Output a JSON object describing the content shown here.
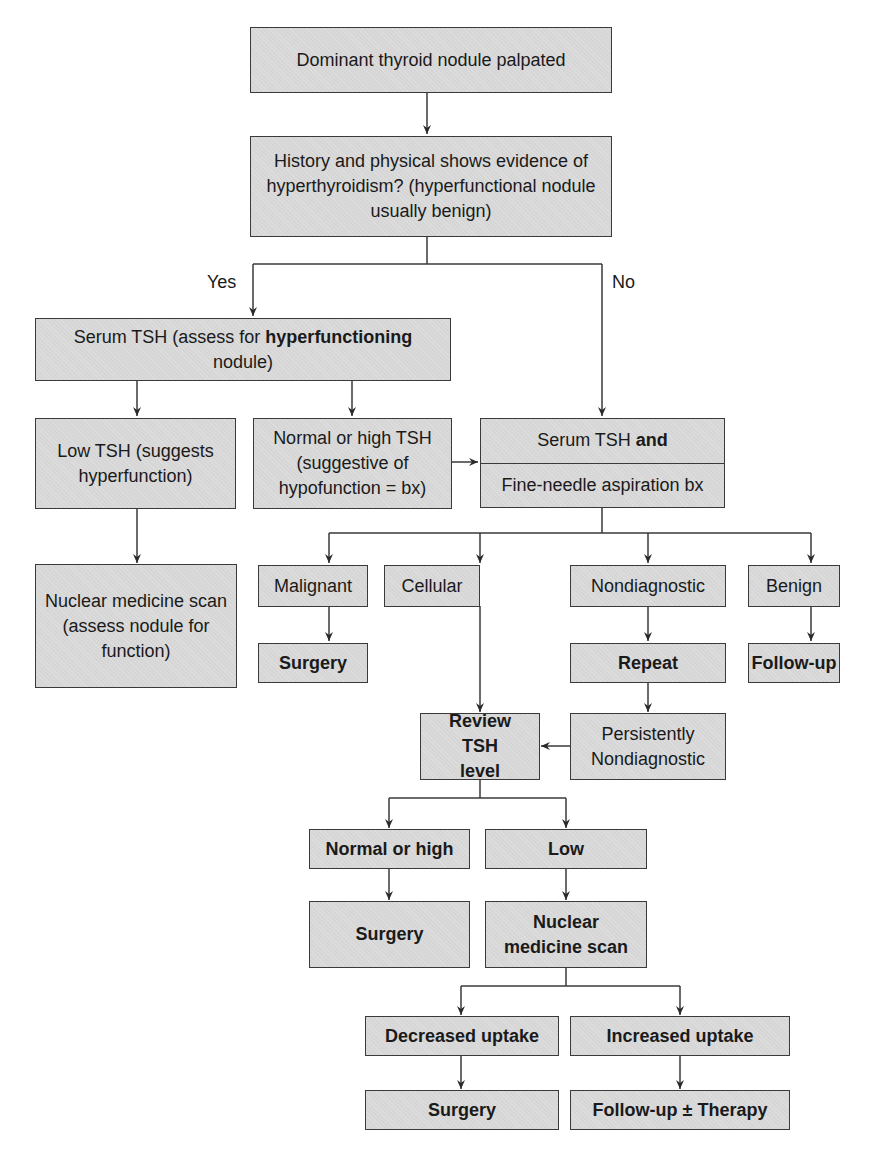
{
  "diagram": {
    "nodes": {
      "start": "Dominant thyroid nodule palpated",
      "history": "History and physical shows evidence of hyperthyroidism? (hyperfunctional nodule usually benign)",
      "serum_tsh_hyper_pre": "Serum TSH (assess for ",
      "serum_tsh_hyper_bold": "hyperfunctioning",
      "serum_tsh_hyper_post": " nodule)",
      "low_tsh": "Low TSH (suggests hyperfunction)",
      "normal_high_tsh": "Normal or high TSH (suggestive of hypofunction = bx)",
      "serum_tsh_and_pre": "Serum TSH ",
      "serum_tsh_and_bold": "and",
      "fna": "Fine-needle aspiration bx",
      "nuclear_scan_assess": "Nuclear medicine scan (assess nodule for function)",
      "malignant": "Malignant",
      "cellular": "Cellular",
      "nondiagnostic": "Nondiagnostic",
      "benign": "Benign",
      "surgery_1": "Surgery",
      "repeat": "Repeat",
      "follow_up": "Follow-up",
      "review_tsh": "Review TSH level",
      "persistently_nondiagnostic": "Persistently Nondiagnostic",
      "normal_or_high": "Normal or high",
      "low": "Low",
      "surgery_2": "Surgery",
      "nuclear_scan": "Nuclear medicine scan",
      "decreased_uptake": "Decreased uptake",
      "increased_uptake": "Increased uptake",
      "surgery_3": "Surgery",
      "follow_up_therapy": "Follow-up ± Therapy"
    },
    "edge_labels": {
      "yes": "Yes",
      "no": "No"
    },
    "colors": {
      "box_fill": "#d6d6d6",
      "line": "#3a3a3a",
      "background": "#ffffff"
    }
  }
}
